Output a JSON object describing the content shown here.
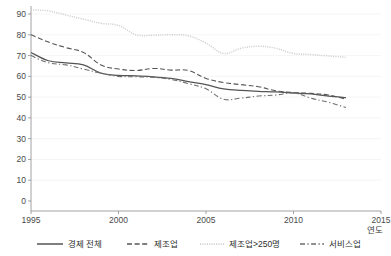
{
  "chart_data": {
    "type": "line",
    "title": "",
    "subtitle": "",
    "xlabel": "연도",
    "ylabel": "",
    "xlim": [
      1995,
      2015
    ],
    "ylim": [
      0,
      95
    ],
    "grid": true,
    "legend_position": "bottom",
    "x_ticks": [
      "1995",
      "2000",
      "2005",
      "2010",
      "2015"
    ],
    "x_tick_values": [
      1995,
      2000,
      2005,
      2010,
      2015
    ],
    "y_ticks": [
      "0",
      "10",
      "20",
      "30",
      "40",
      "50",
      "60",
      "70",
      "80",
      "90"
    ],
    "y_tick_values": [
      0,
      10,
      20,
      30,
      40,
      50,
      60,
      70,
      80,
      90
    ],
    "x": [
      1995,
      1996,
      1997,
      1998,
      1999,
      2000,
      2001,
      2002,
      2003,
      2004,
      2005,
      2006,
      2007,
      2008,
      2009,
      2010,
      2011,
      2012,
      2013
    ],
    "series": [
      {
        "name": "경제 전체",
        "style": "solid",
        "color": "#555555",
        "values": [
          71.5,
          67.5,
          66.5,
          65.5,
          61.5,
          60.5,
          60.2,
          59.8,
          59.0,
          57.5,
          56.0,
          54.0,
          53.2,
          52.8,
          52.5,
          52.0,
          51.5,
          50.5,
          49.8
        ]
      },
      {
        "name": "제조업",
        "style": "dashed",
        "color": "#555555",
        "values": [
          80.0,
          76.5,
          73.8,
          71.5,
          65.5,
          63.5,
          62.8,
          63.8,
          63.0,
          62.8,
          59.0,
          57.0,
          56.0,
          55.0,
          53.0,
          52.2,
          51.8,
          51.0,
          49.0
        ]
      },
      {
        "name": "제조업>250명",
        "style": "dotted",
        "color": "#cfcfcf",
        "values": [
          92.0,
          91.5,
          89.5,
          87.5,
          85.5,
          84.5,
          80.0,
          79.8,
          80.0,
          79.5,
          76.0,
          71.0,
          73.5,
          74.5,
          73.5,
          71.0,
          70.5,
          69.8,
          69.2
        ]
      },
      {
        "name": "서비스업",
        "style": "dashdot",
        "color": "#6e6e6e",
        "values": [
          70.0,
          66.5,
          65.5,
          63.5,
          61.5,
          60.0,
          59.8,
          59.5,
          58.5,
          56.5,
          54.0,
          49.0,
          49.5,
          50.5,
          51.0,
          52.0,
          49.5,
          47.5,
          45.0
        ]
      }
    ]
  },
  "legend": {
    "items": [
      {
        "label": "경제 전체",
        "style": "solid"
      },
      {
        "label": "제조업",
        "style": "dashed"
      },
      {
        "label": "제조업>250명",
        "style": "dotted"
      },
      {
        "label": "서비스업",
        "style": "dashdot"
      }
    ]
  },
  "axis": {
    "x_title": "연도"
  },
  "colors": {
    "grid": "#efefef",
    "axis": "#8c8c8c",
    "text": "#3a3a3a"
  }
}
